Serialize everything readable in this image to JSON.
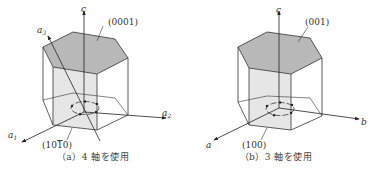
{
  "figures": [
    {
      "id": "a",
      "caption": "（a）4 軸を使用",
      "top_face_label": "(0001)",
      "side_face_label": "(10̅0)",
      "side_face_label_parts": [
        "(10",
        "1",
        "0)"
      ],
      "axes": {
        "c": "c",
        "a1": "a",
        "a1_sub": "1",
        "a2": "a",
        "a2_sub": "2",
        "a3": "a",
        "a3_sub": "3"
      }
    },
    {
      "id": "b",
      "caption": "（b）3 軸を使用",
      "top_face_label": "(001)",
      "side_face_label": "(100)",
      "axes": {
        "c": "c",
        "a": "a",
        "b": "b"
      }
    }
  ],
  "colors": {
    "top_face": "#b8b8b8",
    "side_face": "#e6e6e6",
    "line": "#333333"
  }
}
